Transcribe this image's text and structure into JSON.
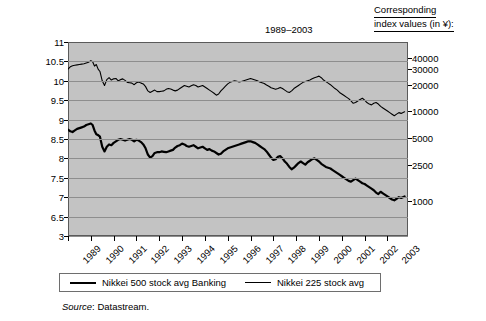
{
  "header": {
    "corresponding_line1": "Corresponding",
    "corresponding_line2": "index values (in ¥):"
  },
  "source": {
    "label": "Source",
    "text": ": Datastream."
  },
  "legend": {
    "items": [
      {
        "label": "Nikkei 500 stock avg Banking",
        "style": "thick",
        "color": "#000000"
      },
      {
        "label": "Nikkei 225 stock avg",
        "style": "thin",
        "color": "#000000"
      }
    ]
  },
  "chart_data": {
    "type": "line",
    "title": "1989–2003",
    "xlabel": "",
    "ylabel": "Index in Log Scale",
    "grid": true,
    "legend_position": "bottom",
    "plot_bg": "#c3c3c3",
    "ylim": [
      6.0,
      11.0
    ],
    "yticks": [
      11,
      10.5,
      10,
      9.5,
      9,
      8.5,
      8,
      7.5,
      7,
      6.5,
      3
    ],
    "ytick_labels": [
      "11",
      "10.5",
      "10",
      "9.5",
      "9",
      "8.5",
      "8",
      "7.5",
      "7",
      "6.5",
      "3"
    ],
    "right_axis_label": "Corresponding index values (in ¥):",
    "right_ticks": [
      {
        "label": "40000",
        "y": 10.597
      },
      {
        "label": "30000",
        "y": 10.309
      },
      {
        "label": "20000",
        "y": 9.903
      },
      {
        "label": "10000",
        "y": 9.21
      },
      {
        "label": "5000",
        "y": 8.517
      },
      {
        "label": "2500",
        "y": 7.824
      },
      {
        "label": "1000",
        "y": 6.908
      }
    ],
    "xlim": [
      1989,
      2003.9
    ],
    "xticks": [
      1989,
      1990,
      1991,
      1992,
      1993,
      1994,
      1995,
      1996,
      1997,
      1998,
      1999,
      2000,
      2001,
      2002,
      2003
    ],
    "xtick_labels": [
      "1989",
      "1990",
      "1991",
      "1992",
      "1993",
      "1994",
      "1995",
      "1996",
      "1997",
      "1998",
      "1999",
      "2000",
      "2001",
      "2002",
      "2003"
    ],
    "series": [
      {
        "name": "Nikkei 225 stock avg",
        "width": "thin",
        "color": "#000000",
        "x": [
          1989.0,
          1989.1,
          1989.2,
          1989.3,
          1989.4,
          1989.5,
          1989.6,
          1989.7,
          1989.8,
          1989.9,
          1990.0,
          1990.08,
          1990.16,
          1990.24,
          1990.32,
          1990.4,
          1990.5,
          1990.6,
          1990.7,
          1990.8,
          1990.9,
          1991.0,
          1991.1,
          1991.2,
          1991.3,
          1991.4,
          1991.5,
          1991.6,
          1991.7,
          1991.8,
          1991.9,
          1992.0,
          1992.1,
          1992.2,
          1992.3,
          1992.4,
          1992.5,
          1992.6,
          1992.7,
          1992.8,
          1992.9,
          1993.0,
          1993.1,
          1993.2,
          1993.3,
          1993.4,
          1993.5,
          1993.6,
          1993.7,
          1993.8,
          1993.9,
          1994.0,
          1994.1,
          1994.2,
          1994.3,
          1994.4,
          1994.5,
          1994.6,
          1994.7,
          1994.8,
          1994.9,
          1995.0,
          1995.1,
          1995.2,
          1995.3,
          1995.4,
          1995.5,
          1995.6,
          1995.7,
          1995.8,
          1995.9,
          1996.0,
          1996.1,
          1996.2,
          1996.3,
          1996.4,
          1996.5,
          1996.6,
          1996.7,
          1996.8,
          1996.9,
          1997.0,
          1997.1,
          1997.2,
          1997.3,
          1997.4,
          1997.5,
          1997.6,
          1997.7,
          1997.8,
          1997.9,
          1998.0,
          1998.1,
          1998.2,
          1998.3,
          1998.4,
          1998.5,
          1998.6,
          1998.7,
          1998.8,
          1998.9,
          1999.0,
          1999.1,
          1999.2,
          1999.3,
          1999.4,
          1999.5,
          1999.6,
          1999.7,
          1999.8,
          1999.9,
          2000.0,
          2000.1,
          2000.2,
          2000.3,
          2000.4,
          2000.5,
          2000.6,
          2000.7,
          2000.8,
          2000.9,
          2001.0,
          2001.1,
          2001.2,
          2001.3,
          2001.4,
          2001.5,
          2001.6,
          2001.7,
          2001.8,
          2001.9,
          2002.0,
          2002.1,
          2002.2,
          2002.3,
          2002.4,
          2002.5,
          2002.6,
          2002.7,
          2002.8,
          2002.9,
          2003.0,
          2003.1,
          2003.2,
          2003.3,
          2003.4,
          2003.5,
          2003.6,
          2003.75
        ],
        "values": [
          10.3,
          10.36,
          10.39,
          10.4,
          10.41,
          10.42,
          10.43,
          10.44,
          10.46,
          10.48,
          10.52,
          10.49,
          10.38,
          10.42,
          10.3,
          10.24,
          10.0,
          9.88,
          10.03,
          10.08,
          10.02,
          10.05,
          10.06,
          10.0,
          10.03,
          10.05,
          10.01,
          9.96,
          9.95,
          9.94,
          9.9,
          9.95,
          9.97,
          9.94,
          9.92,
          9.85,
          9.74,
          9.7,
          9.73,
          9.76,
          9.72,
          9.72,
          9.73,
          9.74,
          9.78,
          9.8,
          9.79,
          9.76,
          9.74,
          9.76,
          9.8,
          9.84,
          9.88,
          9.86,
          9.84,
          9.87,
          9.9,
          9.88,
          9.84,
          9.86,
          9.88,
          9.84,
          9.8,
          9.76,
          9.72,
          9.68,
          9.63,
          9.66,
          9.74,
          9.8,
          9.86,
          9.92,
          9.96,
          9.98,
          10.0,
          9.99,
          9.97,
          9.98,
          10.0,
          10.02,
          10.04,
          10.06,
          10.04,
          10.02,
          10.0,
          9.97,
          9.95,
          9.93,
          9.89,
          9.86,
          9.82,
          9.8,
          9.78,
          9.8,
          9.83,
          9.8,
          9.76,
          9.72,
          9.7,
          9.74,
          9.8,
          9.84,
          9.88,
          9.92,
          9.96,
          9.98,
          10.0,
          10.02,
          10.05,
          10.08,
          10.1,
          10.12,
          10.08,
          10.02,
          9.98,
          9.94,
          9.9,
          9.85,
          9.8,
          9.76,
          9.7,
          9.66,
          9.62,
          9.58,
          9.54,
          9.48,
          9.42,
          9.44,
          9.48,
          9.52,
          9.55,
          9.5,
          9.44,
          9.4,
          9.38,
          9.42,
          9.44,
          9.4,
          9.34,
          9.3,
          9.26,
          9.22,
          9.18,
          9.14,
          9.1,
          9.14,
          9.18,
          9.16,
          9.2
        ]
      },
      {
        "name": "Nikkei 500 stock avg Banking",
        "width": "thick",
        "color": "#000000",
        "x": [
          1989.0,
          1989.1,
          1989.2,
          1989.3,
          1989.4,
          1989.5,
          1989.6,
          1989.7,
          1989.8,
          1989.9,
          1990.0,
          1990.08,
          1990.16,
          1990.24,
          1990.32,
          1990.4,
          1990.5,
          1990.6,
          1990.7,
          1990.8,
          1990.9,
          1991.0,
          1991.1,
          1991.2,
          1991.3,
          1991.4,
          1991.5,
          1991.6,
          1991.7,
          1991.8,
          1991.9,
          1992.0,
          1992.1,
          1992.2,
          1992.3,
          1992.4,
          1992.5,
          1992.6,
          1992.7,
          1992.8,
          1992.9,
          1993.0,
          1993.1,
          1993.2,
          1993.3,
          1993.4,
          1993.5,
          1993.6,
          1993.7,
          1993.8,
          1993.9,
          1994.0,
          1994.1,
          1994.2,
          1994.3,
          1994.4,
          1994.5,
          1994.6,
          1994.7,
          1994.8,
          1994.9,
          1995.0,
          1995.1,
          1995.2,
          1995.3,
          1995.4,
          1995.5,
          1995.6,
          1995.7,
          1995.8,
          1995.9,
          1996.0,
          1996.1,
          1996.2,
          1996.3,
          1996.4,
          1996.5,
          1996.6,
          1996.7,
          1996.8,
          1996.9,
          1997.0,
          1997.1,
          1997.2,
          1997.3,
          1997.4,
          1997.5,
          1997.6,
          1997.7,
          1997.8,
          1997.9,
          1998.0,
          1998.1,
          1998.2,
          1998.3,
          1998.4,
          1998.5,
          1998.6,
          1998.7,
          1998.8,
          1998.9,
          1999.0,
          1999.1,
          1999.2,
          1999.3,
          1999.4,
          1999.5,
          1999.6,
          1999.7,
          1999.8,
          1999.9,
          2000.0,
          2000.1,
          2000.2,
          2000.3,
          2000.4,
          2000.5,
          2000.6,
          2000.7,
          2000.8,
          2000.9,
          2001.0,
          2001.1,
          2001.2,
          2001.3,
          2001.4,
          2001.5,
          2001.6,
          2001.7,
          2001.8,
          2001.9,
          2002.0,
          2002.1,
          2002.2,
          2002.3,
          2002.4,
          2002.5,
          2002.6,
          2002.7,
          2002.8,
          2002.9,
          2003.0,
          2003.1,
          2003.2,
          2003.3,
          2003.4,
          2003.5,
          2003.6,
          2003.75
        ],
        "values": [
          8.74,
          8.7,
          8.68,
          8.72,
          8.76,
          8.78,
          8.8,
          8.82,
          8.86,
          8.88,
          8.9,
          8.86,
          8.72,
          8.62,
          8.6,
          8.56,
          8.3,
          8.18,
          8.3,
          8.36,
          8.34,
          8.4,
          8.44,
          8.48,
          8.5,
          8.48,
          8.46,
          8.48,
          8.5,
          8.48,
          8.44,
          8.48,
          8.46,
          8.42,
          8.36,
          8.26,
          8.1,
          8.02,
          8.06,
          8.14,
          8.16,
          8.16,
          8.18,
          8.17,
          8.16,
          8.18,
          8.2,
          8.22,
          8.28,
          8.32,
          8.34,
          8.38,
          8.36,
          8.32,
          8.3,
          8.32,
          8.34,
          8.3,
          8.26,
          8.28,
          8.3,
          8.26,
          8.22,
          8.24,
          8.2,
          8.18,
          8.14,
          8.1,
          8.12,
          8.18,
          8.22,
          8.26,
          8.28,
          8.3,
          8.32,
          8.34,
          8.36,
          8.38,
          8.4,
          8.42,
          8.44,
          8.44,
          8.42,
          8.4,
          8.36,
          8.32,
          8.28,
          8.24,
          8.18,
          8.1,
          8.02,
          7.96,
          7.98,
          8.04,
          8.06,
          8.0,
          7.92,
          7.86,
          7.78,
          7.72,
          7.76,
          7.82,
          7.88,
          7.92,
          7.88,
          7.84,
          7.9,
          7.94,
          7.98,
          8.0,
          7.96,
          7.92,
          7.86,
          7.82,
          7.78,
          7.76,
          7.74,
          7.7,
          7.66,
          7.62,
          7.58,
          7.54,
          7.5,
          7.46,
          7.42,
          7.4,
          7.44,
          7.48,
          7.44,
          7.4,
          7.36,
          7.34,
          7.3,
          7.26,
          7.22,
          7.18,
          7.12,
          7.08,
          7.14,
          7.1,
          7.06,
          7.02,
          6.98,
          6.94,
          6.92,
          6.96,
          7.0,
          6.98,
          7.02
        ]
      }
    ]
  }
}
